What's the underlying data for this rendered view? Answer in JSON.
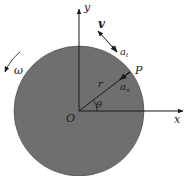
{
  "diagram": {
    "colors": {
      "disk_fill": "#6f6f6f",
      "line": "#1a1a1a",
      "background": "#ffffff"
    },
    "labels": {
      "y_axis": "y",
      "x_axis": "x",
      "origin": "O",
      "point": "P",
      "radius": "r",
      "angle": "θ",
      "velocity": "v",
      "tangential_accel": "a",
      "tangential_sub": "t",
      "normal_accel": "a",
      "normal_sub": "n",
      "angular_velocity": "ω"
    }
  }
}
